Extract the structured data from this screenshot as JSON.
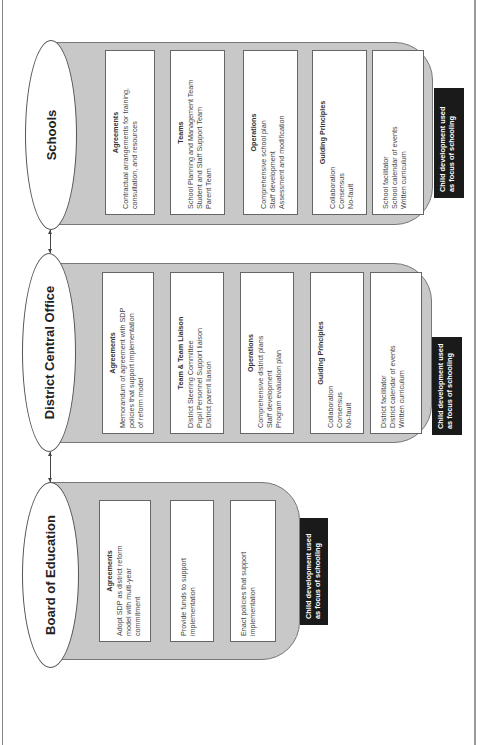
{
  "diagram": {
    "orientation": "rotated-90-ccw",
    "columns": [
      {
        "id": "board",
        "title": "Board of Education",
        "cards": [
          {
            "title": "Agreements",
            "lines": [
              "Adopt SDP as district reform",
              "model with multi-year",
              "commitment"
            ]
          },
          {
            "title": "",
            "lines": [
              "Provide funds to support",
              "implementation"
            ]
          },
          {
            "title": "",
            "lines": [
              "Enact policies that support",
              "implementation"
            ]
          }
        ],
        "focus_label": [
          "Child development used",
          "as focus of schooling"
        ]
      },
      {
        "id": "district",
        "title": "District Central Office",
        "cards": [
          {
            "title": "Agreements",
            "lines": [
              "Memorandum of agreement with SDP",
              "policies that support implementation",
              "of reform model"
            ]
          },
          {
            "title": "Team & Team Liaison",
            "lines": [
              "District Steering Committee",
              "Pupil Personnel Support liaison",
              "District parent liaison"
            ]
          },
          {
            "title": "Operations",
            "lines": [
              "Comprehensive district plans",
              "Staff development",
              "Program evaluation plan"
            ]
          },
          {
            "title": "Guiding Principles",
            "lines": [
              "Collaboration",
              "Consensus",
              "No-fault"
            ]
          },
          {
            "title": "",
            "lines": [
              "District facilitator",
              "District calendar of events",
              "Written curriculum"
            ]
          }
        ],
        "focus_label": [
          "Child development used",
          "as focus of schooling"
        ]
      },
      {
        "id": "schools",
        "title": "Schools",
        "cards": [
          {
            "title": "Agreements",
            "lines": [
              "Contractual arrangements for training,",
              "consultation, and resources"
            ]
          },
          {
            "title": "Teams",
            "lines": [
              "School Planning and Management Team",
              "Student and Staff Support Team",
              "Parent Team"
            ]
          },
          {
            "title": "Operations",
            "lines": [
              "Comprehensive school plan",
              "Staff development",
              "Assessment and modification"
            ]
          },
          {
            "title": "Guiding Principles",
            "lines": [
              "Collaboration",
              "Consensus",
              "No-fault"
            ]
          },
          {
            "title": "",
            "lines": [
              "School facilitator",
              "School calendar of events",
              "Written curriculum"
            ]
          }
        ],
        "focus_label": [
          "Child development used",
          "as focus of schooling"
        ]
      }
    ],
    "connectors": [
      {
        "from": "Board of Education",
        "to": "District Central Office",
        "type": "bidirectional-arrow"
      },
      {
        "from": "District Central Office",
        "to": "Schools",
        "type": "bidirectional-arrow"
      }
    ],
    "colors": {
      "panel_fill": "#c8c8c8",
      "panel_border": "#777777",
      "focus_label_bg": "#1a1a1a",
      "focus_label_text": "#ffffff",
      "card_bg": "#ffffff"
    }
  }
}
